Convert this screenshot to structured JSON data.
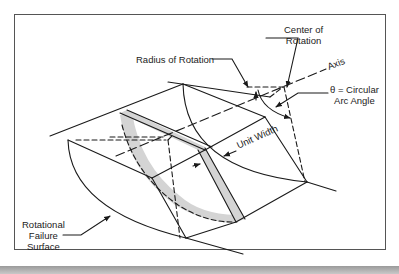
{
  "diagram": {
    "type": "rotational-failure-slice-schematic",
    "labels": {
      "center_of_rotation_line1": "Center of",
      "center_of_rotation_line2": "Rotation",
      "radius_of_rotation": "Radius of Rotation",
      "axis": "Axis",
      "theta_line1": "θ = Circular",
      "theta_line2": "Arc Angle",
      "unit_width": "Unit Width",
      "failure_surface_line1": "Rotational",
      "failure_surface_line2": "Failure",
      "failure_surface_line3": "Surface"
    },
    "colors": {
      "line": "#1a1a1a",
      "slice_fill": "#d4d4d4",
      "frame": "#555555",
      "background": "#ffffff"
    }
  }
}
